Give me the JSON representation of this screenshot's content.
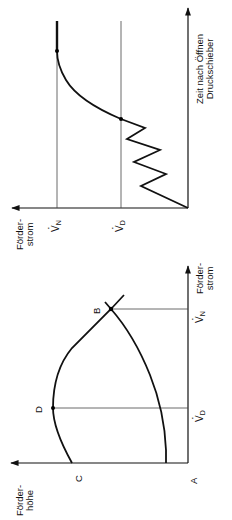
{
  "figure": {
    "orientation": "rotated -90deg (page printed sideways)",
    "top_chart": {
      "name": "flow-over-time",
      "y_axis_label_line1": "Förder-",
      "y_axis_label_line2": "strom",
      "x_axis_label_line1": "Zeit nach Öffnen",
      "x_axis_label_line2": "Druckschieber",
      "level_n_symbol": "V",
      "level_n_sub": "N",
      "level_d_symbol": "V",
      "level_d_sub": "D"
    },
    "bottom_chart": {
      "name": "head-vs-flow",
      "y_axis_label_line1": "Förder-",
      "y_axis_label_line2": "höhe",
      "x_axis_label_line1": "Förder-",
      "x_axis_label_line2": "strom",
      "point_a": "A",
      "point_b": "B",
      "point_c": "C",
      "point_d": "D",
      "tick_d_symbol": "V",
      "tick_d_sub": "D",
      "tick_n_symbol": "V",
      "tick_n_sub": "N"
    }
  },
  "colors": {
    "line": "#111111",
    "grid": "#444444",
    "background": "#ffffff"
  }
}
